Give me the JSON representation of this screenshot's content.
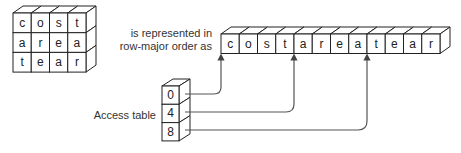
{
  "grid": {
    "rows": [
      [
        "c",
        "o",
        "s",
        "t"
      ],
      [
        "a",
        "r",
        "e",
        "a"
      ],
      [
        "t",
        "e",
        "a",
        "r"
      ]
    ]
  },
  "caption": {
    "line1": "is represented in",
    "line2": "row-major order as"
  },
  "strip": {
    "cells": [
      "c",
      "o",
      "s",
      "t",
      "a",
      "r",
      "e",
      "a",
      "t",
      "e",
      "a",
      "r"
    ]
  },
  "access_table": {
    "label": "Access table",
    "entries": [
      "0",
      "4",
      "8"
    ]
  },
  "colors": {
    "stroke": "#222222",
    "arrow": "#555555",
    "text": "#222222"
  }
}
